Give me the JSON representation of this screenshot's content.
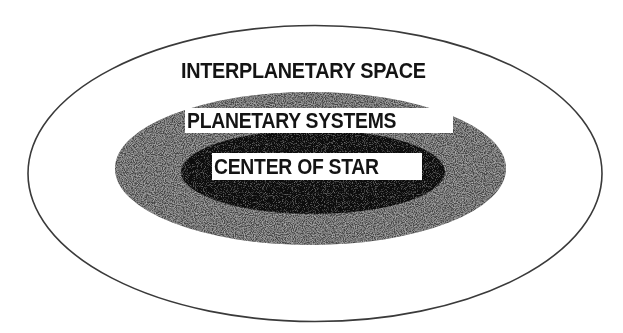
{
  "diagram": {
    "type": "nested-ellipses",
    "regions": [
      {
        "id": "outer",
        "label": "INTERPLANETARY SPACE",
        "fill": "#ffffff",
        "stroke": "#3a3a3a"
      },
      {
        "id": "middle",
        "label": "PLANETARY SYSTEMS",
        "fill": "#4a4a4a",
        "texture": "speckled-gray"
      },
      {
        "id": "inner",
        "label": "CENTER OF STAR",
        "fill": "#0e0e0e",
        "texture": "dark-speckled"
      }
    ]
  },
  "labels": {
    "outer": "INTERPLANETARY SPACE",
    "middle": "PLANETARY SYSTEMS",
    "inner": "CENTER OF STAR"
  },
  "colors": {
    "background": "#ffffff",
    "outline": "#3a3a3a",
    "middle_fill": "#4a4a4a",
    "inner_fill": "#0e0e0e",
    "text": "#141414"
  }
}
